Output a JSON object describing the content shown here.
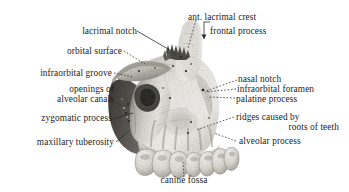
{
  "figure": {
    "subject": "maxilla",
    "view": "lateral",
    "style": "grayscale halftone engraving",
    "background_color": "#ffffff",
    "ink_color": "#1c1c1c"
  },
  "labels": {
    "lacrimal_notch": "lacrimal notch",
    "ant_lacrimal_crest": "ant. lacrimal crest",
    "frontal_process": "frontal process",
    "orbital_surface": "orbital surface",
    "infraorbital_groove": "infraorbital groove",
    "nasal_notch": "nasal notch",
    "openings_of": "openings of",
    "alveolar_canals": "alveolar canals",
    "infraorbital_foramen": "infraorbital foramen",
    "palatine_process": "palatine process",
    "zygomatic_process": "zygomatic process",
    "ridges_caused_by": "ridges caused by",
    "roots_of_teeth": "roots of teeth",
    "maxillary_tuberosity": "maxillary tuberosity",
    "alveolar_process": "alveolar process",
    "canine_fossa": "canine fossa"
  }
}
